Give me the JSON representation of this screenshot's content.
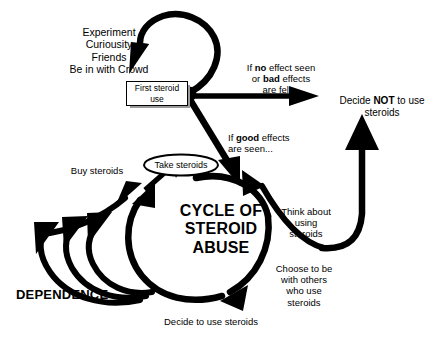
{
  "diagram": {
    "background_color": "#ffffff",
    "ink_color": "#000000",
    "nodes": {
      "entry_reasons": "Experiment\nCuriousity\nFriends\nBe in with Crowd",
      "first_steroid_use": "First steroid use",
      "take_steroids": "Take steroids",
      "buy_steroids": "Buy steroids",
      "dependence": "DEPENDENCE",
      "decide_to_use_steroids": "Decide to use steroids",
      "think_about_using_steroids": "Think about\nusing\nsteroids",
      "choose_to_be_with_others": "Choose to be\nwith others\nwho use\nsteroids",
      "cycle_title_line1": "CYCLE OF",
      "cycle_title_line2": "STEROID",
      "cycle_title_line3": "ABUSE"
    },
    "branch_labels": {
      "negative_outcome": {
        "line1_pre": "If ",
        "line1_bold": "no",
        "line1_post": " effect seen",
        "line2_pre": "or ",
        "line2_bold": "bad",
        "line2_post": " effects",
        "line3": "are felt..."
      },
      "positive_outcome": {
        "line1_pre": "If ",
        "line1_bold": "good",
        "line1_post": " effects",
        "line2": "are seen..."
      },
      "decide_not": {
        "line1_pre": "Decide ",
        "line1_bold": "NOT",
        "line1_post": " to use",
        "line2": "steroids"
      }
    }
  }
}
